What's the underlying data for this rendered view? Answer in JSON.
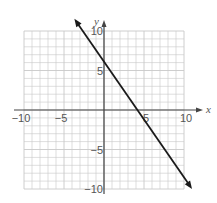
{
  "chart_data": {
    "type": "line",
    "title": "",
    "xlabel": "x",
    "ylabel": "y",
    "xlim": [
      -10,
      10
    ],
    "ylim": [
      -10,
      10
    ],
    "grid": true,
    "grid_step": 1,
    "x_tick_labels": [
      "-10",
      "-5",
      "5",
      "10"
    ],
    "x_ticks": [
      -10,
      -5,
      5,
      10
    ],
    "y_tick_labels": [
      "10",
      "5",
      "-5",
      "-10"
    ],
    "y_ticks": [
      10,
      5,
      -5,
      -10
    ],
    "series": [
      {
        "name": "line",
        "equation": "y = -1.5x + 6",
        "slope": -1.5,
        "intercept": 6,
        "x_intercept": 4,
        "arrows": "both",
        "x": [
          -3,
          0,
          4,
          10
        ],
        "y": [
          10.5,
          6,
          0,
          -9
        ]
      }
    ],
    "legend": null
  },
  "colors": {
    "grid": "#c8c8c8",
    "axis": "#444444",
    "line": "#1a1a1a",
    "text": "#555555"
  }
}
